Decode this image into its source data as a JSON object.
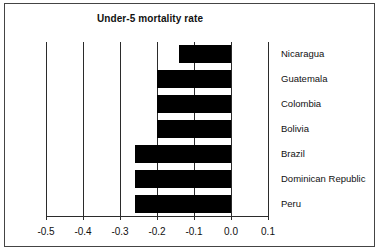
{
  "chart_data": {
    "type": "bar",
    "orientation": "horizontal",
    "title": "Under-5 mortality rate",
    "xlabel": "",
    "ylabel": "",
    "xlim": [
      -0.5,
      0.1
    ],
    "xticks": [
      -0.5,
      -0.4,
      -0.3,
      -0.2,
      -0.1,
      0.0,
      0.1
    ],
    "xticklabels": [
      "-0.5",
      "-0.4",
      "-0.3",
      "-0.2",
      "-0.1",
      "0.0",
      "0.1"
    ],
    "grid": true,
    "legend": null,
    "bar_color": "#000000",
    "categories": [
      "Nicaragua",
      "Guatemala",
      "Colombia",
      "Bolivia",
      "Brazil",
      "Dominican Republic",
      "Peru"
    ],
    "values": [
      -0.14,
      -0.2,
      -0.2,
      -0.2,
      -0.26,
      -0.26,
      -0.26
    ]
  },
  "figure": {
    "frame_color": "#444444",
    "background": "#ffffff"
  }
}
